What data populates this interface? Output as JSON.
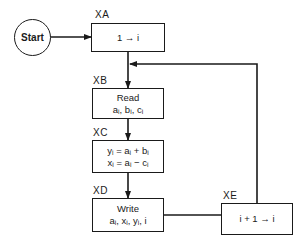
{
  "diagram": {
    "type": "flowchart",
    "nodes": [
      {
        "id": "start",
        "shape": "circle",
        "text": "Start"
      },
      {
        "id": "XA",
        "label": "XA",
        "shape": "box",
        "lines": [
          "1 → i"
        ]
      },
      {
        "id": "XB",
        "label": "XB",
        "shape": "box",
        "lines": [
          "Read",
          "aᵢ, bᵢ, cᵢ"
        ]
      },
      {
        "id": "XC",
        "label": "XC",
        "shape": "box",
        "lines": [
          "yᵢ = aᵢ + bᵢ",
          "xᵢ = aᵢ − cᵢ"
        ]
      },
      {
        "id": "XD",
        "label": "XD",
        "shape": "box",
        "lines": [
          "Write",
          "aᵢ, xᵢ, yᵢ, i"
        ]
      },
      {
        "id": "XE",
        "label": "XE",
        "shape": "box",
        "lines": [
          "i + 1 → i"
        ]
      }
    ],
    "edges": [
      {
        "from": "start",
        "to": "XA"
      },
      {
        "from": "XA",
        "to": "XB"
      },
      {
        "from": "XB",
        "to": "XC"
      },
      {
        "from": "XC",
        "to": "XD"
      },
      {
        "from": "XD",
        "to": "XE"
      },
      {
        "from": "XE",
        "to": "XB",
        "note": "loop back, joins XA→XB line"
      }
    ]
  },
  "start": {
    "text": "Start"
  },
  "xa": {
    "label": "XA",
    "line1": "1 → i"
  },
  "xb": {
    "label": "XB",
    "line1": "Read",
    "line2": "aᵢ, bᵢ, cᵢ"
  },
  "xc": {
    "label": "XC",
    "line1": "yᵢ = aᵢ + bᵢ",
    "line2": "xᵢ = aᵢ − cᵢ"
  },
  "xd": {
    "label": "XD",
    "line1": "Write",
    "line2": "aᵢ, xᵢ, yᵢ, i"
  },
  "xe": {
    "label": "XE",
    "line1": "i + 1 → i"
  }
}
